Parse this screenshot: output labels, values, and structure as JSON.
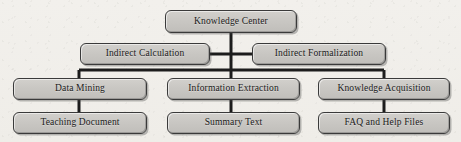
{
  "diagram": {
    "type": "organizational-hierarchy",
    "colors": {
      "background": "#f2f0ec",
      "node_fill": "#c9c7c3",
      "node_border": "#3a3a3a",
      "connector": "#1c1c1c",
      "text": "#1a1a1a"
    },
    "nodes": [
      {
        "id": "knowledge-center",
        "label": "Knowledge Center",
        "level": 1
      },
      {
        "id": "indirect-calculation",
        "label": "Indirect Calculation",
        "level": 2
      },
      {
        "id": "indirect-formalization",
        "label": "Indirect Formalization",
        "level": 2
      },
      {
        "id": "data-mining",
        "label": "Data Mining",
        "level": 3
      },
      {
        "id": "information-extraction",
        "label": "Information Extraction",
        "level": 3
      },
      {
        "id": "knowledge-acquisition",
        "label": "Knowledge Acquisition",
        "level": 3
      },
      {
        "id": "teaching-document",
        "label": "Teaching Document",
        "level": 4
      },
      {
        "id": "summary-text",
        "label": "Summary Text",
        "level": 4
      },
      {
        "id": "faq-help-files",
        "label": "FAQ and Help Files",
        "level": 4
      }
    ],
    "edges": [
      {
        "from": "knowledge-center",
        "to": "indirect-calculation"
      },
      {
        "from": "knowledge-center",
        "to": "indirect-formalization"
      },
      {
        "from": "knowledge-center",
        "to": "data-mining"
      },
      {
        "from": "knowledge-center",
        "to": "information-extraction"
      },
      {
        "from": "knowledge-center",
        "to": "knowledge-acquisition"
      },
      {
        "from": "data-mining",
        "to": "teaching-document"
      },
      {
        "from": "information-extraction",
        "to": "summary-text"
      },
      {
        "from": "knowledge-acquisition",
        "to": "faq-help-files"
      }
    ]
  }
}
